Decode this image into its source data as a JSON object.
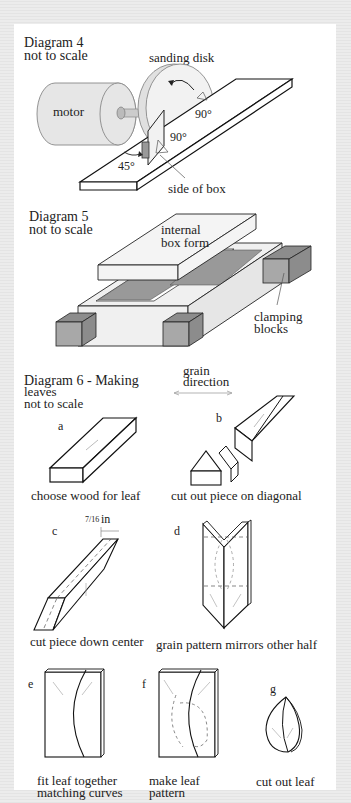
{
  "diagram4": {
    "title": "Diagram 4",
    "subtitle": "not to scale",
    "labels": {
      "sanding_disk": "sanding disk",
      "motor": "motor",
      "angle_top": "90°",
      "angle_mid": "90°",
      "angle_45": "45°",
      "side_of_box": "side of box"
    }
  },
  "diagram5": {
    "title": "Diagram 5",
    "subtitle": "not to scale",
    "labels": {
      "internal_box_form_1": "internal",
      "internal_box_form_2": "box form",
      "clamping_1": "clamping",
      "clamping_2": "blocks"
    }
  },
  "diagram6": {
    "title": "Diagram 6 - Making",
    "title_2": "leaves",
    "subtitle": "not to scale",
    "grain_1": "grain",
    "grain_2": "direction",
    "fraction": "7/16",
    "unit": "in",
    "steps": [
      {
        "letter": "a",
        "caption": "choose wood for leaf"
      },
      {
        "letter": "b",
        "caption": "cut out piece on diagonal"
      },
      {
        "letter": "c",
        "caption": "cut piece down center"
      },
      {
        "letter": "d",
        "caption": "grain pattern mirrors other half"
      },
      {
        "letter": "e",
        "caption": "fit leaf together",
        "caption_2": "matching curves"
      },
      {
        "letter": "f",
        "caption": "make leaf",
        "caption_2": "pattern"
      },
      {
        "letter": "g",
        "caption": "cut out leaf"
      }
    ]
  },
  "colors": {
    "motor_fill": "#e6e6e6",
    "block_fill": "#a8a8a8",
    "block_dark": "#8c8c8c",
    "form_fill": "#ededed",
    "outline": "#222222"
  }
}
